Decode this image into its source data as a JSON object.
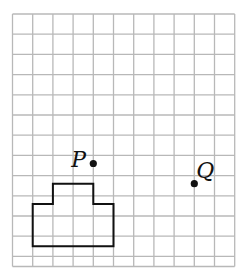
{
  "grid": {
    "origin_x": 12.5,
    "origin_y": 14,
    "cell": 20.2,
    "cols": 11,
    "rows": 12.5,
    "line_color": "#b8b8b8"
  },
  "points": [
    {
      "id": "P",
      "label": "P",
      "gx": 4,
      "gy": 7.4,
      "label_dx": -22,
      "label_dy": 4
    },
    {
      "id": "Q",
      "label": "Q",
      "gx": 9,
      "gy": 8.4,
      "label_dx": 2,
      "label_dy": -6
    }
  ],
  "shape": {
    "name": "stepped-polygon",
    "vertices": [
      [
        1,
        11.5
      ],
      [
        5,
        11.5
      ],
      [
        5,
        9.4
      ],
      [
        4,
        9.4
      ],
      [
        4,
        8.4
      ],
      [
        2,
        8.4
      ],
      [
        2,
        9.4
      ],
      [
        1,
        9.4
      ]
    ],
    "stroke": "#111111"
  }
}
